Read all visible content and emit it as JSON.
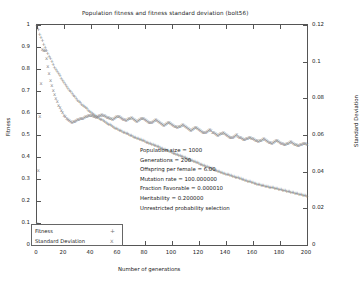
{
  "chart_data": {
    "type": "scatter",
    "title": "Population fitness and fitness standard deviation (bolt56)",
    "xlabel": "Number of generations",
    "ylabel": "Fitness",
    "y2label": "Standard Deviation",
    "xlim": [
      0,
      200
    ],
    "ylim": [
      0,
      1
    ],
    "y2lim": [
      0,
      0.12
    ],
    "grid": false,
    "legend_position": "bottom-left",
    "xticks": [
      0,
      20,
      40,
      60,
      80,
      100,
      120,
      140,
      160,
      180,
      200
    ],
    "xticklabels": [
      "0",
      "20",
      "40",
      "60",
      "80",
      "100",
      "120",
      "140",
      "160",
      "180",
      "200"
    ],
    "yticks": [
      0,
      0.1,
      0.2,
      0.3,
      0.4,
      0.5,
      0.6,
      0.7,
      0.8,
      0.9,
      1
    ],
    "yticklabels": [
      "0",
      "0.1",
      "0.2",
      "0.3",
      "0.4",
      "0.5",
      "0.6",
      "0.7",
      "0.8",
      "0.9",
      "1"
    ],
    "y2ticks": [
      0,
      0.02,
      0.04,
      0.06,
      0.08,
      0.1,
      0.12
    ],
    "y2ticklabels": [
      "0",
      "0.02",
      "0.04",
      "0.06",
      "0.08",
      "0.1",
      "0.12"
    ],
    "series": [
      {
        "name": "Fitness",
        "axis": "left",
        "marker": "+",
        "color": "#777777",
        "x": [
          0,
          2,
          4,
          6,
          8,
          10,
          12,
          14,
          16,
          18,
          20,
          22,
          24,
          26,
          28,
          30,
          32,
          34,
          36,
          38,
          40,
          42,
          44,
          46,
          48,
          50,
          52,
          54,
          56,
          58,
          60,
          62,
          64,
          66,
          68,
          70,
          72,
          74,
          76,
          78,
          80,
          82,
          84,
          86,
          88,
          90,
          92,
          94,
          96,
          98,
          100,
          102,
          104,
          106,
          108,
          110,
          112,
          114,
          116,
          118,
          120,
          122,
          124,
          126,
          128,
          130,
          132,
          134,
          136,
          138,
          140,
          142,
          144,
          146,
          148,
          150,
          152,
          154,
          156,
          158,
          160,
          162,
          164,
          166,
          168,
          170,
          172,
          174,
          176,
          178,
          180,
          182,
          184,
          186,
          188,
          190,
          192,
          194,
          196,
          198,
          200
        ],
        "y": [
          1.0,
          0.96,
          0.93,
          0.9,
          0.87,
          0.85,
          0.82,
          0.8,
          0.78,
          0.76,
          0.74,
          0.72,
          0.705,
          0.69,
          0.675,
          0.66,
          0.648,
          0.636,
          0.625,
          0.615,
          0.605,
          0.595,
          0.586,
          0.578,
          0.57,
          0.562,
          0.554,
          0.547,
          0.54,
          0.533,
          0.527,
          0.521,
          0.515,
          0.509,
          0.503,
          0.498,
          0.492,
          0.487,
          0.482,
          0.477,
          0.472,
          0.467,
          0.462,
          0.457,
          0.452,
          0.447,
          0.442,
          0.437,
          0.432,
          0.427,
          0.422,
          0.417,
          0.412,
          0.407,
          0.402,
          0.397,
          0.392,
          0.387,
          0.382,
          0.377,
          0.372,
          0.367,
          0.362,
          0.357,
          0.352,
          0.347,
          0.342,
          0.337,
          0.332,
          0.328,
          0.324,
          0.32,
          0.316,
          0.312,
          0.308,
          0.304,
          0.3,
          0.296,
          0.292,
          0.288,
          0.284,
          0.28,
          0.277,
          0.274,
          0.271,
          0.268,
          0.265,
          0.262,
          0.259,
          0.256,
          0.253,
          0.25,
          0.247,
          0.244,
          0.241,
          0.238,
          0.235,
          0.232,
          0.229,
          0.226,
          0.223
        ]
      },
      {
        "name": "Standard Deviation",
        "axis": "right",
        "marker": "x",
        "color": "#8a8a8a",
        "x": [
          0,
          2,
          4,
          6,
          8,
          10,
          12,
          14,
          16,
          18,
          20,
          22,
          24,
          26,
          28,
          30,
          32,
          34,
          36,
          38,
          40,
          42,
          44,
          46,
          48,
          50,
          52,
          54,
          56,
          58,
          60,
          62,
          64,
          66,
          68,
          70,
          72,
          74,
          76,
          78,
          80,
          82,
          84,
          86,
          88,
          90,
          92,
          94,
          96,
          98,
          100,
          102,
          104,
          106,
          108,
          110,
          112,
          114,
          116,
          118,
          120,
          122,
          124,
          126,
          128,
          130,
          132,
          134,
          136,
          138,
          140,
          142,
          144,
          146,
          148,
          150,
          152,
          154,
          156,
          158,
          160,
          162,
          164,
          166,
          168,
          170,
          172,
          174,
          176,
          178,
          180,
          182,
          184,
          186,
          188,
          190,
          192,
          194,
          196,
          198,
          200
        ],
        "y": [
          0.0118,
          0.07,
          0.107,
          0.106,
          0.0975,
          0.09,
          0.0845,
          0.08,
          0.0765,
          0.0735,
          0.071,
          0.069,
          0.068,
          0.0672,
          0.0678,
          0.0684,
          0.069,
          0.0694,
          0.07,
          0.0706,
          0.071,
          0.0704,
          0.0698,
          0.0706,
          0.0712,
          0.0706,
          0.0698,
          0.0692,
          0.0686,
          0.0696,
          0.0704,
          0.0696,
          0.0688,
          0.0682,
          0.069,
          0.0698,
          0.0688,
          0.0678,
          0.0686,
          0.0694,
          0.0686,
          0.0676,
          0.0668,
          0.0676,
          0.0684,
          0.0674,
          0.0664,
          0.0656,
          0.0664,
          0.0672,
          0.066,
          0.065,
          0.0642,
          0.065,
          0.0658,
          0.0646,
          0.0636,
          0.0628,
          0.0636,
          0.0644,
          0.0632,
          0.0622,
          0.0614,
          0.0622,
          0.063,
          0.0618,
          0.0608,
          0.06,
          0.0608,
          0.0616,
          0.0604,
          0.0594,
          0.0586,
          0.0594,
          0.0602,
          0.059,
          0.0582,
          0.0576,
          0.0584,
          0.059,
          0.058,
          0.0572,
          0.0566,
          0.0574,
          0.058,
          0.057,
          0.0562,
          0.0558,
          0.0566,
          0.0572,
          0.0562,
          0.0554,
          0.055,
          0.0558,
          0.0564,
          0.0554,
          0.0548,
          0.0544,
          0.0552,
          0.0558,
          0.0548
        ]
      }
    ],
    "annotations": [
      "Population size = 1000",
      "Generations = 200",
      "Offspring per female = 6.00",
      "Mutation rate = 100.000000",
      "Fraction Favorable = 0.000010",
      "Heritability = 0.200000",
      "Unrestricted probability selection"
    ]
  }
}
